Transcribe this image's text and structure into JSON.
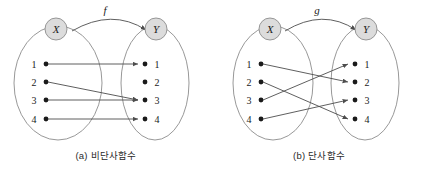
{
  "figure": {
    "panels": [
      {
        "id": "a",
        "caption": "(a) 비단사함수",
        "map_label": "f",
        "domain_label": "X",
        "codomain_label": "Y",
        "domain_elements": [
          "1",
          "2",
          "3",
          "4"
        ],
        "codomain_elements": [
          "1",
          "2",
          "3",
          "4"
        ],
        "mappings": [
          {
            "from": "1",
            "to": "1"
          },
          {
            "from": "2",
            "to": "3"
          },
          {
            "from": "3",
            "to": "3"
          },
          {
            "from": "4",
            "to": "4"
          }
        ]
      },
      {
        "id": "b",
        "caption": "(b) 단사함수",
        "map_label": "g",
        "domain_label": "X",
        "codomain_label": "Y",
        "domain_elements": [
          "1",
          "2",
          "3",
          "4"
        ],
        "codomain_elements": [
          "1",
          "2",
          "3",
          "4"
        ],
        "mappings": [
          {
            "from": "1",
            "to": "2"
          },
          {
            "from": "2",
            "to": "4"
          },
          {
            "from": "3",
            "to": "1"
          },
          {
            "from": "4",
            "to": "3"
          }
        ]
      }
    ],
    "bottom_text": "",
    "colors": {
      "stroke": "#4d4d4d",
      "ellipse_stroke": "#8c8c8c",
      "circle_fill": "#dcdcdc",
      "circle_stroke": "#8c8c8c",
      "text": "#1a1a1a"
    }
  }
}
